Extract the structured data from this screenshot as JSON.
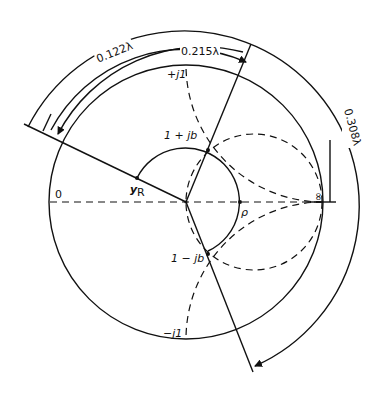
{
  "diagram": {
    "type": "smith-chart-admittance-matching",
    "labels": {
      "arc_outer": "0.308λ",
      "arc_middle": "0.122λ",
      "arc_inner": "0.215λ",
      "plus_j1": "+j1",
      "minus_j1": "−j1",
      "point_upper": "1 + jb",
      "point_lower": "1 − jb",
      "y_r": "y",
      "y_r_sub": "R",
      "rho": "ρ",
      "zero": "0",
      "infinity": "∞"
    },
    "colors": {
      "ink": "#111111",
      "background": "#ffffff"
    }
  }
}
